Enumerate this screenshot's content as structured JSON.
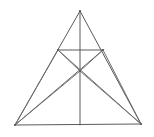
{
  "figure": {
    "type": "geometric-line-drawing",
    "background_color": "#ffffff",
    "canvas": {
      "width": 154,
      "height": 137
    },
    "style": {
      "stroke_color": "#6e6e6e",
      "stroke_color_dark": "#5a5a5a",
      "stroke_width": 1
    },
    "points": {
      "apex": {
        "name": "A",
        "x": 80,
        "y": 11
      },
      "bottom_left": {
        "name": "B",
        "x": 15,
        "y": 125
      },
      "bottom_right": {
        "name": "C",
        "x": 141,
        "y": 124
      },
      "base_midpoint": {
        "name": "M",
        "x": 80,
        "y": 125
      },
      "chord_left": {
        "name": "D",
        "x": 58,
        "y": 50
      },
      "chord_right": {
        "name": "E",
        "x": 103,
        "y": 50
      },
      "center_node": {
        "name": "P",
        "x": 80,
        "y": 71
      }
    },
    "segments": [
      {
        "id": "left-side",
        "label": "A-B",
        "from": "apex",
        "to": "bottom_left",
        "role": "triangle-edge"
      },
      {
        "id": "right-side",
        "label": "A-C",
        "from": "apex",
        "to": "bottom_right",
        "role": "triangle-edge"
      },
      {
        "id": "base",
        "label": "B-C",
        "from": "bottom_left",
        "to": "bottom_right",
        "role": "triangle-edge"
      },
      {
        "id": "median-vertical",
        "label": "A-M",
        "from": "apex",
        "to": "base_midpoint",
        "role": "median"
      },
      {
        "id": "horizontal-chord",
        "label": "D-E",
        "from": "chord_left",
        "to": "chord_right",
        "role": "chord"
      },
      {
        "id": "chord-left-to-node",
        "label": "D-P",
        "from": "chord_left",
        "to": "center_node",
        "role": "diagonal"
      },
      {
        "id": "chord-right-to-node",
        "label": "E-P",
        "from": "chord_right",
        "to": "center_node",
        "role": "diagonal"
      },
      {
        "id": "bl-to-chord-left",
        "label": "B-D",
        "from": "bottom_left",
        "to": "chord_left",
        "role": "cevian"
      },
      {
        "id": "br-to-chord-right",
        "label": "C-E",
        "from": "bottom_right",
        "to": "chord_right",
        "role": "cevian"
      },
      {
        "id": "bl-to-node",
        "label": "B-P",
        "from": "bottom_left",
        "to": "center_node",
        "role": "cevian"
      },
      {
        "id": "br-to-node",
        "label": "C-P",
        "from": "bottom_right",
        "to": "center_node",
        "role": "cevian"
      },
      {
        "id": "bl-to-node-extended",
        "label": "B-P-E",
        "from": "bottom_left",
        "to": "chord_right",
        "role": "cevian-extended"
      },
      {
        "id": "br-to-node-extended",
        "label": "C-P-D",
        "from": "bottom_right",
        "to": "chord_left",
        "role": "cevian-extended"
      }
    ],
    "vertex_markers": [
      {
        "at": "apex"
      },
      {
        "at": "bottom_left"
      },
      {
        "at": "bottom_right"
      },
      {
        "at": "center_node"
      },
      {
        "at": "chord_left"
      },
      {
        "at": "chord_right"
      }
    ]
  }
}
